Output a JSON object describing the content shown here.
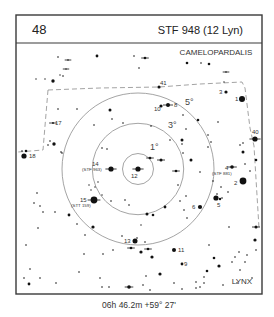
{
  "header": {
    "chart_number": "48",
    "title": "STF 948 (12 Lyn)"
  },
  "footer": {
    "coordinates": "06h 46.2m  +59° 27'"
  },
  "constellations": [
    {
      "name": "CAMELOPARDALIS",
      "x": 216,
      "y": 55
    },
    {
      "name": "LYNX",
      "x": 242,
      "y": 284
    }
  ],
  "rings": {
    "center": [
      138,
      169
    ],
    "items": [
      {
        "label": "1°",
        "radius": 15.5,
        "lx": 150,
        "ly": 150
      },
      {
        "label": "3°",
        "radius": 45.7,
        "lx": 168,
        "ly": 128
      },
      {
        "label": "5°",
        "radius": 76,
        "lx": 185,
        "ly": 105
      }
    ]
  },
  "boundary_paths": [
    "M48,90 L100,88 L159,87 L200,84 L242,82 L245,88 L250,128 L254,146 L259,228",
    "M48,90 L43,150 L18,152"
  ],
  "labeled_stars": [
    {
      "id": "1",
      "x": 242,
      "y": 99,
      "r": 3,
      "lx": 235,
      "ly": 101,
      "tick": false
    },
    {
      "id": "2",
      "x": 243,
      "y": 181,
      "r": 3.4,
      "lx": 234,
      "ly": 185,
      "tick": false
    },
    {
      "id": "3",
      "x": 226,
      "y": 92,
      "r": 1.6,
      "lx": 219,
      "ly": 94,
      "tick": false
    },
    {
      "id": "4",
      "x": 232,
      "y": 167,
      "r": 1.8,
      "lx": 225,
      "ly": 170,
      "tick": true,
      "sub": "(STF 881)",
      "sx": 212,
      "sy": 175
    },
    {
      "id": "5",
      "x": 216,
      "y": 198,
      "r": 2.6,
      "lx": 217,
      "ly": 207,
      "tick": false
    },
    {
      "id": "6",
      "x": 200,
      "y": 207,
      "r": 2.1,
      "lx": 192,
      "ly": 209,
      "tick": false
    },
    {
      "id": "8",
      "x": 168,
      "y": 105,
      "r": 2,
      "lx": 174,
      "ly": 107,
      "tick": true
    },
    {
      "id": "9",
      "x": 182,
      "y": 264,
      "r": 1.4,
      "lx": 184,
      "ly": 266,
      "tick": false
    },
    {
      "id": "10",
      "x": 161,
      "y": 106,
      "r": 1.6,
      "lx": 154,
      "ly": 111,
      "tick": false
    },
    {
      "id": "11",
      "x": 174,
      "y": 250,
      "r": 2,
      "lx": 178,
      "ly": 252,
      "tick": false
    },
    {
      "id": "12",
      "x": 138,
      "y": 169,
      "r": 2.6,
      "lx": 131,
      "ly": 178,
      "tick": true
    },
    {
      "id": "13",
      "x": 135,
      "y": 241,
      "r": 2.5,
      "lx": 124,
      "ly": 243,
      "tick": false
    },
    {
      "id": "14",
      "x": 111,
      "y": 169,
      "r": 2.6,
      "lx": 92,
      "ly": 166,
      "tick": true,
      "sub": "(STF 963)",
      "sx": 82,
      "sy": 171
    },
    {
      "id": "15",
      "x": 94,
      "y": 200,
      "r": 3.4,
      "lx": 80,
      "ly": 202,
      "tick": true,
      "sub": "(STT 159)",
      "sx": 71,
      "sy": 207
    },
    {
      "id": "17",
      "x": 53,
      "y": 123,
      "r": 0.9,
      "lx": 55,
      "ly": 125,
      "tick": true
    },
    {
      "id": "18",
      "x": 24,
      "y": 156,
      "r": 2.6,
      "lx": 29,
      "ly": 158,
      "tick": false
    },
    {
      "id": "40",
      "x": 255,
      "y": 139,
      "r": 2.6,
      "lx": 252,
      "ly": 134,
      "tick": true
    },
    {
      "id": "41",
      "x": 159,
      "y": 87,
      "r": 1.6,
      "lx": 160,
      "ly": 85,
      "tick": false
    }
  ],
  "stars": [
    [
      58,
      57,
      0.8
    ],
    [
      68,
      60,
      0.8,
      1
    ],
    [
      97,
      56,
      1.4
    ],
    [
      134,
      56,
      0.8
    ],
    [
      145,
      58,
      1.3,
      1
    ],
    [
      66,
      69,
      0.7,
      1
    ],
    [
      63,
      76,
      0.8
    ],
    [
      139,
      68,
      0.8
    ],
    [
      53,
      81,
      1.7
    ],
    [
      45,
      79,
      0.7
    ],
    [
      36,
      79,
      0.7
    ],
    [
      60,
      75,
      0.7
    ],
    [
      187,
      63,
      1.3
    ],
    [
      201,
      63,
      0.8
    ],
    [
      209,
      64,
      1.3
    ],
    [
      226,
      72,
      0.8,
      1
    ],
    [
      224,
      82,
      0.7
    ],
    [
      58,
      109,
      0.8
    ],
    [
      77,
      109,
      0.8
    ],
    [
      112,
      119,
      0.8
    ],
    [
      123,
      123,
      0.8
    ],
    [
      151,
      126,
      0.8
    ],
    [
      94,
      125,
      0.8
    ],
    [
      110,
      110,
      1.5
    ],
    [
      183,
      115,
      0.8
    ],
    [
      50,
      141,
      0.8
    ],
    [
      54,
      144,
      1.7
    ],
    [
      62,
      153,
      0.8
    ],
    [
      61,
      152,
      0.8
    ],
    [
      48,
      145,
      0.8
    ],
    [
      22,
      151,
      0.8
    ],
    [
      26,
      151,
      1.3
    ],
    [
      102,
      148,
      0.8
    ],
    [
      107,
      149,
      0.8
    ],
    [
      198,
      120,
      1.3
    ],
    [
      208,
      135,
      0.8
    ],
    [
      218,
      122,
      0.8
    ],
    [
      186,
      129,
      0.8
    ],
    [
      170,
      140,
      0.8
    ],
    [
      182,
      140,
      1.5
    ],
    [
      182,
      144,
      0.8
    ],
    [
      211,
      142,
      0.8
    ],
    [
      208,
      147,
      0.8
    ],
    [
      240,
      145,
      0.8
    ],
    [
      243,
      143,
      0.8
    ],
    [
      243,
      152,
      1.5
    ],
    [
      256,
      160,
      1.3
    ],
    [
      245,
      164,
      0.8
    ],
    [
      250,
      171,
      0.8
    ],
    [
      191,
      160,
      1.5
    ],
    [
      200,
      172,
      0.8
    ],
    [
      161,
      160,
      1.5,
      1
    ],
    [
      150,
      158,
      1.3,
      1
    ],
    [
      176,
      171,
      1.3,
      1
    ],
    [
      183,
      153,
      0.8
    ],
    [
      178,
      185,
      0.8
    ],
    [
      186,
      196,
      0.8
    ],
    [
      180,
      201,
      0.8
    ],
    [
      184,
      210,
      0.8
    ],
    [
      213,
      181,
      0.8
    ],
    [
      221,
      187,
      0.8
    ],
    [
      228,
      192,
      0.8
    ],
    [
      217,
      194,
      0.8
    ],
    [
      222,
      198,
      0.8
    ],
    [
      220,
      199,
      1.2
    ],
    [
      95,
      187,
      0.7
    ],
    [
      98,
      182,
      0.7
    ],
    [
      102,
      195,
      0.7
    ],
    [
      91,
      190,
      0.7
    ],
    [
      89,
      185,
      0.7
    ],
    [
      111,
      201,
      0.8
    ],
    [
      125,
      200,
      0.8
    ],
    [
      129,
      205,
      0.8
    ],
    [
      147,
      214,
      1.5
    ],
    [
      165,
      207,
      1.4
    ],
    [
      153,
      215,
      1.3
    ],
    [
      141,
      225,
      0.7
    ],
    [
      187,
      218,
      0.8
    ],
    [
      229,
      227,
      0.8
    ],
    [
      256,
      227,
      1.5,
      1
    ],
    [
      34,
      203,
      0.8
    ],
    [
      37,
      193,
      0.8
    ],
    [
      40,
      206,
      0.8
    ],
    [
      43,
      212,
      0.8
    ],
    [
      38,
      228,
      0.8
    ],
    [
      26,
      245,
      0.8
    ],
    [
      69,
      215,
      1.4
    ],
    [
      77,
      224,
      0.8
    ],
    [
      85,
      235,
      0.8
    ],
    [
      93,
      227,
      1.6
    ],
    [
      55,
      212,
      0.8
    ],
    [
      122,
      236,
      0.8
    ],
    [
      137,
      238,
      0.8
    ],
    [
      145,
      242,
      0.8
    ],
    [
      113,
      250,
      0.8
    ],
    [
      141,
      252,
      1.6
    ],
    [
      131,
      248,
      1.3,
      1
    ],
    [
      148,
      249,
      1.3,
      1
    ],
    [
      152,
      257,
      1.6
    ],
    [
      103,
      254,
      0.8
    ],
    [
      84,
      254,
      0.8
    ],
    [
      30,
      269,
      0.8
    ],
    [
      24,
      278,
      0.8
    ],
    [
      40,
      278,
      0.8
    ],
    [
      29,
      284,
      1.4
    ],
    [
      56,
      283,
      0.8
    ],
    [
      79,
      272,
      0.8
    ],
    [
      100,
      278,
      0.8
    ],
    [
      102,
      287,
      0.8
    ],
    [
      109,
      287,
      0.8
    ],
    [
      129,
      287,
      1.8,
      1
    ],
    [
      143,
      285,
      0.8
    ],
    [
      146,
      276,
      0.8
    ],
    [
      160,
      274,
      1.6
    ],
    [
      174,
      283,
      0.8
    ],
    [
      182,
      289,
      0.8
    ],
    [
      196,
      288,
      0.8
    ],
    [
      200,
      287,
      0.8
    ],
    [
      204,
      283,
      0.8
    ],
    [
      204,
      277,
      0.8
    ],
    [
      150,
      290,
      0.8
    ],
    [
      207,
      271,
      1.3
    ],
    [
      219,
      266,
      1.6
    ],
    [
      237,
      283,
      0.8
    ],
    [
      240,
      270,
      0.8
    ],
    [
      239,
      252,
      0.8
    ],
    [
      245,
      262,
      0.8
    ],
    [
      247,
      255,
      0.8
    ],
    [
      255,
      240,
      1.6
    ],
    [
      256,
      250,
      0.8
    ],
    [
      252,
      278,
      0.8
    ],
    [
      223,
      285,
      0.8
    ],
    [
      214,
      258,
      1.3
    ],
    [
      196,
      282,
      0.8
    ],
    [
      232,
      262,
      0.8
    ],
    [
      235,
      257,
      0.8
    ],
    [
      209,
      245,
      0.8
    ]
  ]
}
